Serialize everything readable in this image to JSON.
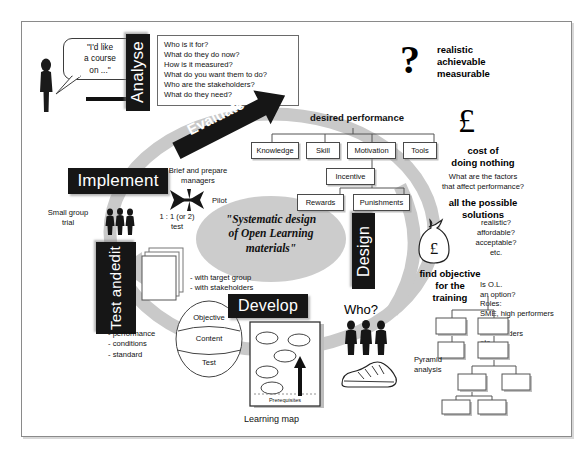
{
  "diagram": {
    "title": "Systematic design of Open Learning materials",
    "centre_label": "\"Systematic design\nof Open Learning\nmaterials\"",
    "centre_lines": [
      "\"Systematic design",
      "of Open Learning",
      "materials\""
    ]
  },
  "stages": {
    "analyse": "Analyse",
    "evaluate": "Evaluate",
    "implement": "Implement",
    "test_and_edit": [
      "Test and",
      "edit"
    ],
    "develop": "Develop",
    "design": "Design"
  },
  "analyse": {
    "speech_bubble": [
      "\"I'd like",
      "a course",
      "on ...\""
    ],
    "person_icon": "person-silhouette-icon",
    "arrow_icon": "right-arrow-icon",
    "questions": [
      "Who is it for?",
      "What do they do now?",
      "How is it measured?",
      "What do you want them to do?",
      "Who are the stakeholders?",
      "What do they need?"
    ]
  },
  "evaluate": {
    "heading": "desired performance",
    "criteria_icon": "question-mark-icon",
    "criteria": [
      "realistic",
      "achievable",
      "measurable"
    ],
    "tree_row1": [
      "Knowledge",
      "Skill",
      "Motivation",
      "Tools"
    ],
    "tree_row2": [
      "Incentive"
    ],
    "tree_row3": [
      "Rewards",
      "Punishments"
    ],
    "cost_icon": "pound-sterling-icon",
    "cost_heading": [
      "cost of",
      "doing nothing"
    ],
    "factors": [
      "What are the factors",
      "that affect performance?"
    ]
  },
  "design": {
    "solutions_heading": [
      "all the possible",
      "solutions"
    ],
    "money_bag_icon": "money-bag-pound-icon",
    "criteria": [
      "realistic?",
      "affordable?",
      "acceptable?",
      "etc."
    ],
    "objective_heading": [
      "find objective",
      "for the",
      "training"
    ],
    "roles": [
      "Is O.L.",
      "an option?",
      "Roles:",
      "SME, high performers",
      "client",
      "stakeholders",
      "etc."
    ],
    "pyramid_label": [
      "Pyramid",
      "analysis"
    ]
  },
  "develop": {
    "who_label": "Who?",
    "people_icon": "three-people-icon",
    "trainer_icon": "running-shoe-icon",
    "learning_map_caption": "Learning map",
    "prerequisites_label": "Prerequisites",
    "up_arrow_icon": "up-arrow-icon"
  },
  "test_and_edit": {
    "docs_icon": "stacked-pages-icon",
    "with_whom": [
      "- with target group",
      "- with stakeholders"
    ],
    "objective_parts": [
      "Objective",
      "Content",
      "Test"
    ],
    "objective_detail": [
      "- performance",
      "- conditions",
      "- standard"
    ]
  },
  "implement": {
    "brief_managers": [
      "Brief and prepare",
      "managers"
    ],
    "plane_icon": "aeroplane-icon",
    "pilot_label": "Pilot",
    "small_group": [
      "Small group",
      "trial"
    ],
    "people_icon": "three-people-icon",
    "one_to_one": [
      "1 : 1 (or 2)",
      "test"
    ]
  },
  "colors": {
    "plate_bg": "#161616",
    "plate_fg": "#ffffff",
    "ring_gray": "#c9c9c9",
    "ellipse_gray": "#cccccc",
    "border": "#8a8a8a",
    "ink": "#111111"
  }
}
